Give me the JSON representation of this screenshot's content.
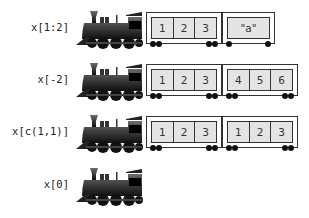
{
  "rows": [
    {
      "label": "x[1:2]",
      "cars": [
        {
          "cells": [
            "1",
            "2",
            "3"
          ]
        },
        {
          "cells": [
            "\"a\""
          ]
        }
      ]
    },
    {
      "label": "x[-2]",
      "cars": [
        {
          "cells": [
            "1",
            "2",
            "3"
          ]
        },
        {
          "cells": [
            "4",
            "5",
            "6"
          ]
        }
      ]
    },
    {
      "label": "x[c(1,1)]",
      "cars": [
        {
          "cells": [
            "1",
            "2",
            "3"
          ]
        },
        {
          "cells": [
            "1",
            "2",
            "3"
          ]
        }
      ]
    },
    {
      "label": "x[0]",
      "cars": []
    }
  ],
  "colors": {
    "cell_fill": "#e4e4e4",
    "outline": "#333333",
    "engine": "#2a2a2a"
  }
}
